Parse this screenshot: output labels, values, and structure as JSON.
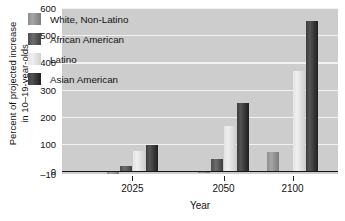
{
  "chart_data": {
    "type": "bar",
    "title": "",
    "xlabel": "Year",
    "ylabel": "Percent of projected increase\nin 10–19-year-olds",
    "categories": [
      "2025",
      "2050",
      "2100"
    ],
    "ylim": [
      -10,
      600
    ],
    "yticks": [
      -10,
      0,
      100,
      200,
      300,
      400,
      500,
      600
    ],
    "ytick_labels": [
      "–10",
      "0",
      "100",
      "200",
      "300",
      "400",
      "500",
      "600"
    ],
    "grid": "horizontal-white-gridlines",
    "legend_position": "inside-top-left",
    "series": [
      {
        "name": "White, Non-Latino",
        "color": "#8e8e8e",
        "values": [
          -9,
          -8,
          70
        ]
      },
      {
        "name": "African American",
        "color": "#4c4c4c",
        "values": [
          18,
          45,
          0
        ]
      },
      {
        "name": "Latino",
        "color": "#e4e4e4",
        "values": [
          73,
          165,
          368
        ]
      },
      {
        "name": "Asian American",
        "color": "#3c3c3c",
        "values": [
          95,
          252,
          551
        ]
      }
    ]
  },
  "legend": {
    "items": [
      {
        "label": "White, Non-Latino",
        "swatch_class": "c0"
      },
      {
        "label": "African American",
        "swatch_class": "c1"
      },
      {
        "label": "Latino",
        "swatch_class": "c2"
      },
      {
        "label": "Asian American",
        "swatch_class": "c3"
      }
    ]
  },
  "axes": {
    "y_title": "Percent of projected increase\nin 10–19-year-olds",
    "x_title": "Year"
  },
  "colors": {
    "plot_background": "#cdcdcd",
    "gridline": "#f2f2f2",
    "axis": "#151515",
    "page_background": "#ffffff"
  }
}
